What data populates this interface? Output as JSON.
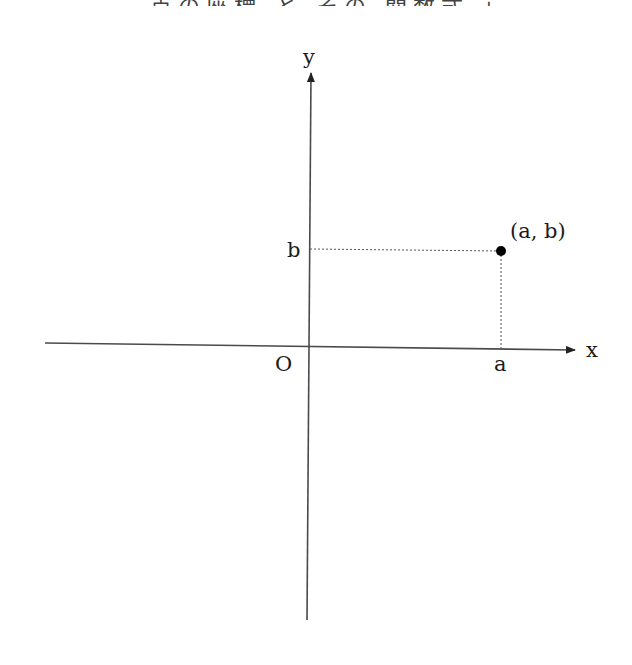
{
  "header": {
    "clipped_text": "点の座標 と その 関数式 」"
  },
  "diagram": {
    "axes": {
      "x_label": "x",
      "y_label": "y",
      "origin_label": "O"
    },
    "point": {
      "label": "(a, b)",
      "x_label": "a",
      "y_label": "b"
    }
  },
  "colors": {
    "axis": "#4a4a4a",
    "dotted": "#555555",
    "point": "#000000"
  }
}
